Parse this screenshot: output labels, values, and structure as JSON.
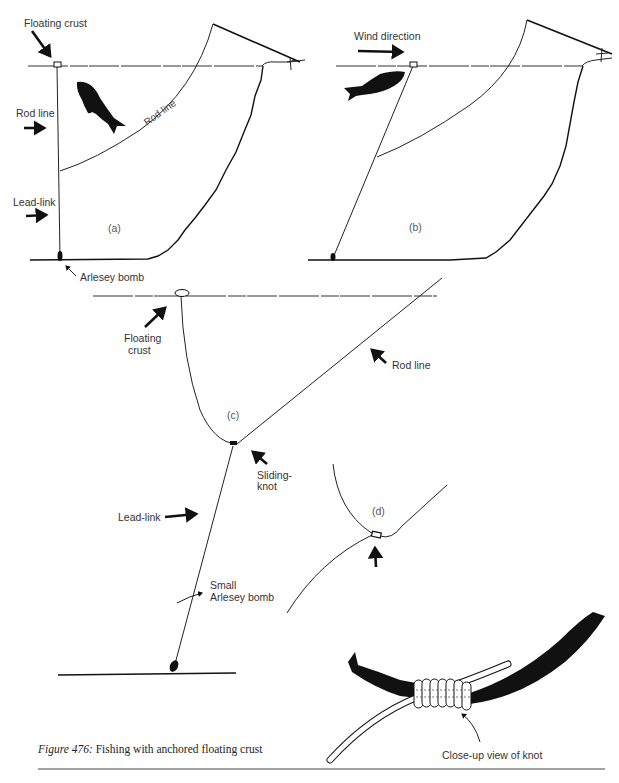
{
  "figure": {
    "caption_prefix": "Figure 476:",
    "caption_text": " Fishing with anchored floating crust"
  },
  "panels": {
    "a": {
      "label": "(a)",
      "annotations": {
        "floating_crust": "Floating crust",
        "rod_line_left": "Rod line",
        "rod_line_along": "Rod line",
        "lead_link": "Lead-link",
        "arlesey_bomb": "Arlesey bomb"
      }
    },
    "b": {
      "label": "(b)",
      "annotations": {
        "wind_direction": "Wind direction"
      }
    },
    "c": {
      "label": "(c)",
      "annotations": {
        "floating_crust_line1": "Floating",
        "floating_crust_line2": "crust",
        "rod_line": "Rod line",
        "sliding_knot_line1": "Sliding-",
        "sliding_knot_line2": "knot",
        "lead_link": "Lead-link",
        "small_bomb_line1": "Small",
        "small_bomb_line2": "Arlesey bomb"
      }
    },
    "d": {
      "label": "(d)"
    },
    "closeup": {
      "annotations": {
        "closeup_label": "Close-up view of knot"
      }
    }
  },
  "colors": {
    "ink": "#111111",
    "paper": "#ffffff",
    "label_text": "#333333"
  }
}
